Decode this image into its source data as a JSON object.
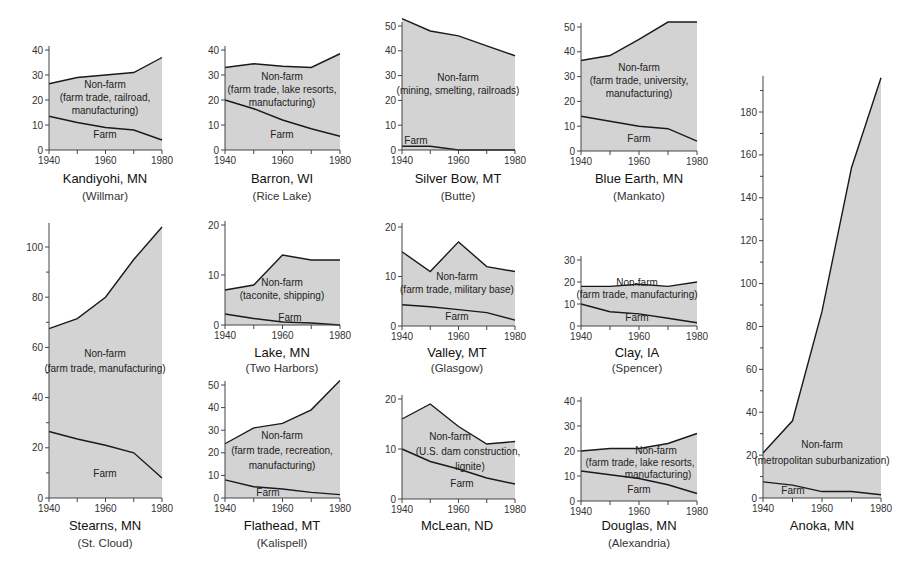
{
  "chart_data": [
    {
      "type": "area",
      "title": "Kandiyohi, MN",
      "subtitle": "(Willmar)",
      "x": [
        1940,
        1950,
        1960,
        1970,
        1980
      ],
      "xticks": [
        "1940",
        "1960",
        "1980"
      ],
      "ylim": [
        0,
        40
      ],
      "yticks": [
        0,
        10,
        20,
        30,
        40
      ],
      "series": [
        {
          "name": "Total",
          "values": [
            26.5,
            29,
            30,
            31,
            37
          ]
        },
        {
          "name": "Farm",
          "values": [
            13.5,
            11,
            9,
            8,
            4
          ]
        }
      ],
      "labels": {
        "nonfarm": [
          "Non-farm",
          "(farm trade, railroad,",
          "manufacturing)"
        ],
        "farm": "Farm"
      }
    },
    {
      "type": "area",
      "title": "Barron, WI",
      "subtitle": "(Rice Lake)",
      "x": [
        1940,
        1950,
        1960,
        1970,
        1980
      ],
      "xticks": [
        "1940",
        "1960",
        "1980"
      ],
      "ylim": [
        0,
        40
      ],
      "yticks": [
        0,
        10,
        20,
        30,
        40
      ],
      "series": [
        {
          "name": "Total",
          "values": [
            33,
            34.5,
            33.5,
            33,
            38.5
          ]
        },
        {
          "name": "Farm",
          "values": [
            20,
            16.5,
            12,
            8.5,
            5.5
          ]
        }
      ],
      "labels": {
        "nonfarm": [
          "Non-farm",
          "(farm trade, lake resorts,",
          "manufacturing)"
        ],
        "farm": "Farm"
      }
    },
    {
      "type": "area",
      "title": "Silver Bow, MT",
      "subtitle": "(Butte)",
      "x": [
        1940,
        1950,
        1960,
        1970,
        1980
      ],
      "xticks": [
        "1940",
        "1960",
        "1980"
      ],
      "ylim": [
        0,
        50
      ],
      "yticks": [
        0,
        10,
        20,
        30,
        40,
        50
      ],
      "series": [
        {
          "name": "Total",
          "values": [
            53,
            48,
            46,
            42,
            38
          ]
        },
        {
          "name": "Farm",
          "values": [
            1.5,
            1.5,
            0,
            0,
            0
          ]
        }
      ],
      "labels": {
        "nonfarm": [
          "Non-farm",
          "(mining, smelting, railroads)"
        ],
        "farm": "Farm"
      }
    },
    {
      "type": "area",
      "title": "Blue Earth, MN",
      "subtitle": "(Mankato)",
      "x": [
        1940,
        1950,
        1960,
        1970,
        1980
      ],
      "xticks": [
        "1940",
        "1960",
        "1980"
      ],
      "ylim": [
        0,
        50
      ],
      "yticks": [
        0,
        10,
        20,
        30,
        40,
        50
      ],
      "series": [
        {
          "name": "Total",
          "values": [
            36.5,
            38.5,
            45,
            52,
            52
          ]
        },
        {
          "name": "Farm",
          "values": [
            14,
            12,
            10,
            9,
            4
          ]
        }
      ],
      "labels": {
        "nonfarm": [
          "Non-farm",
          "(farm trade, university,",
          "manufacturing)"
        ],
        "farm": "Farm"
      }
    },
    {
      "type": "area",
      "title": "Anoka, MN",
      "subtitle": "",
      "x": [
        1940,
        1950,
        1960,
        1970,
        1980
      ],
      "xticks": [
        "1940",
        "1960",
        "1980"
      ],
      "ylim": [
        0,
        195
      ],
      "yticks": [
        0,
        20,
        40,
        60,
        80,
        100,
        120,
        140,
        160,
        180
      ],
      "series": [
        {
          "name": "Total",
          "values": [
            21,
            36,
            87,
            154,
            196
          ]
        },
        {
          "name": "Farm",
          "values": [
            7.5,
            6,
            3,
            3,
            1.5
          ]
        }
      ],
      "labels": {
        "nonfarm": [
          "Non-farm",
          "(metropolitan suburbanization)"
        ],
        "farm": "Farm"
      }
    },
    {
      "type": "area",
      "title": "Stearns, MN",
      "subtitle": "(St. Cloud)",
      "x": [
        1940,
        1950,
        1960,
        1970,
        1980
      ],
      "xticks": [
        "1940",
        "1960",
        "1980"
      ],
      "ylim": [
        0,
        108
      ],
      "yticks": [
        0,
        20,
        40,
        60,
        80,
        100
      ],
      "series": [
        {
          "name": "Total",
          "values": [
            67.5,
            71.5,
            80,
            95,
            108
          ]
        },
        {
          "name": "Farm",
          "values": [
            26.5,
            23.5,
            21,
            18,
            8
          ]
        }
      ],
      "labels": {
        "nonfarm": [
          "Non-farm",
          "(farm trade, manufacturing)"
        ],
        "farm": "Farm"
      }
    },
    {
      "type": "area",
      "title": "Lake, MN",
      "subtitle": "(Two Harbors)",
      "x": [
        1940,
        1950,
        1960,
        1970,
        1980
      ],
      "xticks": [
        "1940",
        "1960",
        "1980"
      ],
      "ylim": [
        0,
        20
      ],
      "yticks": [
        0,
        10,
        20
      ],
      "series": [
        {
          "name": "Total",
          "values": [
            7,
            8,
            14,
            13,
            13
          ]
        },
        {
          "name": "Farm",
          "values": [
            2.2,
            1.3,
            0.6,
            0.4,
            0
          ]
        }
      ],
      "labels": {
        "nonfarm": [
          "Non-farm",
          "(taconite, shipping)"
        ],
        "farm": "Farm"
      }
    },
    {
      "type": "area",
      "title": "Valley, MT",
      "subtitle": "(Glasgow)",
      "x": [
        1940,
        1950,
        1960,
        1970,
        1980
      ],
      "xticks": [
        "1940",
        "1960",
        "1980"
      ],
      "ylim": [
        0,
        20
      ],
      "yticks": [
        0,
        10,
        20
      ],
      "series": [
        {
          "name": "Total",
          "values": [
            15,
            11,
            17,
            12,
            11
          ]
        },
        {
          "name": "Farm",
          "values": [
            4.3,
            3.9,
            3.3,
            2.7,
            1.2
          ]
        }
      ],
      "labels": {
        "nonfarm": [
          "Non-farm",
          "(farm trade, military base)"
        ],
        "farm": "Farm"
      }
    },
    {
      "type": "area",
      "title": "Clay, IA",
      "subtitle": "(Spencer)",
      "x": [
        1940,
        1950,
        1960,
        1970,
        1980
      ],
      "xticks": [
        "1940",
        "1960",
        "1980"
      ],
      "ylim": [
        0,
        30
      ],
      "yticks": [
        0,
        10,
        20,
        30
      ],
      "series": [
        {
          "name": "Total",
          "values": [
            18,
            18,
            19,
            18,
            20
          ]
        },
        {
          "name": "Farm",
          "values": [
            10,
            6.5,
            5.5,
            3.5,
            1.5
          ]
        }
      ],
      "labels": {
        "nonfarm": [
          "Non-farm",
          "(farm trade, manufacturing)"
        ],
        "farm": "Farm"
      }
    },
    {
      "type": "area",
      "title": "Flathead, MT",
      "subtitle": "(Kalispell)",
      "x": [
        1940,
        1950,
        1960,
        1970,
        1980
      ],
      "xticks": [
        "1940",
        "1960",
        "1980"
      ],
      "ylim": [
        0,
        50
      ],
      "yticks": [
        0,
        10,
        20,
        30,
        40,
        50
      ],
      "series": [
        {
          "name": "Total",
          "values": [
            24,
            31,
            33,
            39,
            52
          ]
        },
        {
          "name": "Farm",
          "values": [
            8,
            5,
            4,
            2.5,
            1.5
          ]
        }
      ],
      "labels": {
        "nonfarm": [
          "Non-farm",
          "(farm trade, recreation,",
          "manufacturing)"
        ],
        "farm": "Farm"
      }
    },
    {
      "type": "area",
      "title": "McLean, ND",
      "subtitle": "",
      "x": [
        1940,
        1950,
        1960,
        1970,
        1980
      ],
      "xticks": [
        "1940",
        "1960",
        "1980"
      ],
      "ylim": [
        0,
        20
      ],
      "yticks": [
        0,
        10,
        20
      ],
      "series": [
        {
          "name": "Total",
          "values": [
            16,
            19,
            14.5,
            11,
            11.5
          ]
        },
        {
          "name": "Farm",
          "values": [
            10,
            7.5,
            6,
            4.2,
            3
          ]
        }
      ],
      "labels": {
        "nonfarm": [
          "Non-farm",
          "(U.S. dam construction,",
          "lignite)"
        ],
        "farm": "Farm"
      }
    },
    {
      "type": "area",
      "title": "Douglas, MN",
      "subtitle": "(Alexandria)",
      "x": [
        1940,
        1950,
        1960,
        1970,
        1980
      ],
      "xticks": [
        "1940",
        "1960",
        "1980"
      ],
      "ylim": [
        0,
        40
      ],
      "yticks": [
        0,
        10,
        20,
        30,
        40
      ],
      "series": [
        {
          "name": "Total",
          "values": [
            20,
            21,
            21,
            23,
            27
          ]
        },
        {
          "name": "Farm",
          "values": [
            12,
            10.5,
            9,
            6.5,
            3
          ]
        }
      ],
      "labels": {
        "nonfarm": [
          "Non-farm",
          "(farm trade, lake resorts,",
          "manufacturing)"
        ],
        "farm": "Farm"
      }
    }
  ],
  "colors": {
    "area_fill": "#d3d3d3",
    "line": "#1a1a1a",
    "axis": "#444444"
  }
}
